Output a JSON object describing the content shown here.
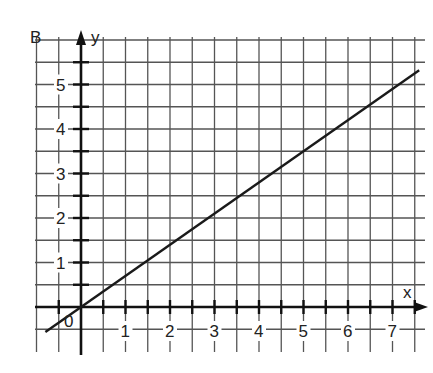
{
  "chart_data": {
    "type": "line",
    "title": "",
    "graph_label": "B",
    "xlabel": "x",
    "ylabel": "y",
    "origin_label": "0",
    "x_ticks": [
      "1",
      "2",
      "3",
      "4",
      "5",
      "6",
      "7"
    ],
    "y_ticks": [
      "1",
      "2",
      "3",
      "4",
      "5"
    ],
    "xlim": [
      -1,
      7.5
    ],
    "ylim": [
      -0.5,
      5.5
    ],
    "grid": true,
    "grid_step": 0.5,
    "series": [
      {
        "name": "line",
        "equation": "y = 0.7x",
        "x": [
          -0.8,
          0,
          5,
          7.6
        ],
        "y": [
          -0.56,
          0,
          3.5,
          5.32
        ]
      }
    ],
    "line_color": "#1a1a1a",
    "grid_color": "#555555"
  }
}
